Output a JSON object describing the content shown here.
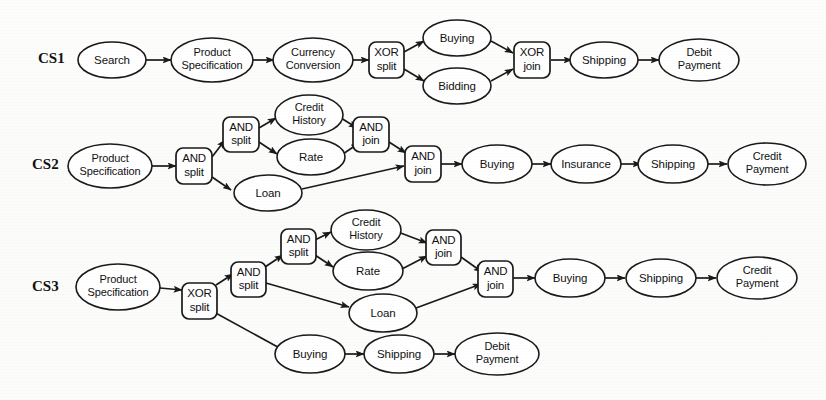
{
  "figure": {
    "rows": [
      {
        "id": "CS1",
        "label": "CS1",
        "nodes": [
          {
            "key": "cs1_search",
            "kind": "task",
            "label": "Search"
          },
          {
            "key": "cs1_prodspec",
            "kind": "task",
            "label": "Product Specification",
            "line1": "Product",
            "line2": "Specification"
          },
          {
            "key": "cs1_currency",
            "kind": "task",
            "label": "Currency Conversion",
            "line1": "Currency",
            "line2": "Conversion"
          },
          {
            "key": "cs1_xor_split",
            "kind": "gateway",
            "label": "XOR split",
            "line1": "XOR",
            "line2": "split"
          },
          {
            "key": "cs1_buying",
            "kind": "task",
            "label": "Buying"
          },
          {
            "key": "cs1_bidding",
            "kind": "task",
            "label": "Bidding"
          },
          {
            "key": "cs1_xor_join",
            "kind": "gateway",
            "label": "XOR join",
            "line1": "XOR",
            "line2": "join"
          },
          {
            "key": "cs1_shipping",
            "kind": "task",
            "label": "Shipping"
          },
          {
            "key": "cs1_debit",
            "kind": "task",
            "label": "Debit Payment",
            "line1": "Debit",
            "line2": "Payment"
          }
        ]
      },
      {
        "id": "CS2",
        "label": "CS2",
        "nodes": [
          {
            "key": "cs2_prodspec",
            "kind": "task",
            "label": "Product Specification",
            "line1": "Product",
            "line2": "Specification"
          },
          {
            "key": "cs2_and_split1",
            "kind": "gateway",
            "label": "AND split",
            "line1": "AND",
            "line2": "split"
          },
          {
            "key": "cs2_and_split2",
            "kind": "gateway",
            "label": "AND split",
            "line1": "AND",
            "line2": "split"
          },
          {
            "key": "cs2_credit_hist",
            "kind": "task",
            "label": "Credit History",
            "line1": "Credit",
            "line2": "History"
          },
          {
            "key": "cs2_rate",
            "kind": "task",
            "label": "Rate"
          },
          {
            "key": "cs2_and_join1",
            "kind": "gateway",
            "label": "AND join",
            "line1": "AND",
            "line2": "join"
          },
          {
            "key": "cs2_loan",
            "kind": "task",
            "label": "Loan"
          },
          {
            "key": "cs2_and_join2",
            "kind": "gateway",
            "label": "AND join",
            "line1": "AND",
            "line2": "join"
          },
          {
            "key": "cs2_buying",
            "kind": "task",
            "label": "Buying"
          },
          {
            "key": "cs2_insurance",
            "kind": "task",
            "label": "Insurance"
          },
          {
            "key": "cs2_shipping",
            "kind": "task",
            "label": "Shipping"
          },
          {
            "key": "cs2_credit_pay",
            "kind": "task",
            "label": "Credit Payment",
            "line1": "Credit",
            "line2": "Payment"
          }
        ]
      },
      {
        "id": "CS3",
        "label": "CS3",
        "nodes": [
          {
            "key": "cs3_prodspec",
            "kind": "task",
            "label": "Product Specification",
            "line1": "Product",
            "line2": "Specification"
          },
          {
            "key": "cs3_xor_split",
            "kind": "gateway",
            "label": "XOR split",
            "line1": "XOR",
            "line2": "split"
          },
          {
            "key": "cs3_and_split1",
            "kind": "gateway",
            "label": "AND split",
            "line1": "AND",
            "line2": "split"
          },
          {
            "key": "cs3_and_split2",
            "kind": "gateway",
            "label": "AND split",
            "line1": "AND",
            "line2": "split"
          },
          {
            "key": "cs3_credit_hist",
            "kind": "task",
            "label": "Credit History",
            "line1": "Credit",
            "line2": "History"
          },
          {
            "key": "cs3_rate",
            "kind": "task",
            "label": "Rate"
          },
          {
            "key": "cs3_and_join1",
            "kind": "gateway",
            "label": "AND join",
            "line1": "AND",
            "line2": "join"
          },
          {
            "key": "cs3_loan",
            "kind": "task",
            "label": "Loan"
          },
          {
            "key": "cs3_and_join2",
            "kind": "gateway",
            "label": "AND join",
            "line1": "AND",
            "line2": "join"
          },
          {
            "key": "cs3_buying_top",
            "kind": "task",
            "label": "Buying"
          },
          {
            "key": "cs3_shipping_top",
            "kind": "task",
            "label": "Shipping"
          },
          {
            "key": "cs3_credit_pay",
            "kind": "task",
            "label": "Credit Payment",
            "line1": "Credit",
            "line2": "Payment"
          },
          {
            "key": "cs3_buying_bot",
            "kind": "task",
            "label": "Buying"
          },
          {
            "key": "cs3_shipping_bot",
            "kind": "task",
            "label": "Shipping"
          },
          {
            "key": "cs3_debit_pay",
            "kind": "task",
            "label": "Debit Payment",
            "line1": "Debit",
            "line2": "Payment"
          }
        ]
      }
    ],
    "colors": {
      "ink": "#1a1a1a",
      "paper": "#ffffff",
      "text": "#111111"
    }
  }
}
